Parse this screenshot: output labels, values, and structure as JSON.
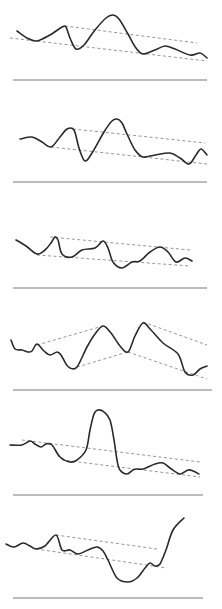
{
  "figure": {
    "colors": {
      "curve": "#2a2a2a",
      "trendline": "#8a8a8a",
      "baseline": "#7a7a7a",
      "background": "#ffffff"
    }
  },
  "chart_data": [
    {
      "type": "line",
      "title": "",
      "xlabel": "",
      "ylabel": "",
      "grid": false,
      "series": [
        {
          "name": "curve",
          "points": [
            [
              17,
              31
            ],
            [
              27,
              38
            ],
            [
              37,
              41
            ],
            [
              50,
              35
            ],
            [
              62,
              27
            ],
            [
              66,
              27
            ],
            [
              70,
              38
            ],
            [
              76,
              49
            ],
            [
              84,
              45
            ],
            [
              95,
              30
            ],
            [
              106,
              18
            ],
            [
              113,
              15
            ],
            [
              119,
              19
            ],
            [
              128,
              34
            ],
            [
              136,
              48
            ],
            [
              143,
              54
            ],
            [
              155,
              50
            ],
            [
              165,
              46
            ],
            [
              175,
              49
            ],
            [
              190,
              55
            ],
            [
              200,
              53
            ],
            [
              207,
              58
            ]
          ]
        }
      ],
      "trendlines": [
        [
          [
            65,
            26
          ],
          [
            197,
            43
          ]
        ],
        [
          [
            10,
            38
          ],
          [
            207,
            61
          ]
        ]
      ],
      "baseline": {
        "y": 80,
        "x1": 13,
        "x2": 207
      }
    },
    {
      "type": "line",
      "title": "",
      "xlabel": "",
      "ylabel": "",
      "grid": false,
      "series": [
        {
          "name": "curve",
          "points": [
            [
              20,
              139
            ],
            [
              32,
              137
            ],
            [
              42,
              142
            ],
            [
              51,
              147
            ],
            [
              60,
              137
            ],
            [
              67,
              129
            ],
            [
              74,
              130
            ],
            [
              79,
              148
            ],
            [
              85,
              161
            ],
            [
              92,
              153
            ],
            [
              104,
              132
            ],
            [
              112,
              121
            ],
            [
              117,
              119
            ],
            [
              122,
              123
            ],
            [
              127,
              134
            ],
            [
              135,
              150
            ],
            [
              143,
              157
            ],
            [
              155,
              155
            ],
            [
              170,
              153
            ],
            [
              180,
              158
            ],
            [
              189,
              164
            ],
            [
              196,
              155
            ],
            [
              201,
              149
            ],
            [
              207,
              155
            ]
          ]
        }
      ],
      "trendlines": [
        [
          [
            73,
            129
          ],
          [
            205,
            143
          ]
        ],
        [
          [
            51,
            147
          ],
          [
            207,
            164
          ]
        ]
      ],
      "baseline": {
        "y": 182,
        "x1": 13,
        "x2": 207
      }
    },
    {
      "type": "line",
      "title": "",
      "xlabel": "",
      "ylabel": "",
      "grid": false,
      "series": [
        {
          "name": "curve",
          "points": [
            [
              16,
              240
            ],
            [
              26,
              246
            ],
            [
              37,
              254
            ],
            [
              45,
              250
            ],
            [
              51,
              243
            ],
            [
              55,
              237
            ],
            [
              58,
              240
            ],
            [
              62,
              254
            ],
            [
              72,
              257
            ],
            [
              82,
              250
            ],
            [
              95,
              248
            ],
            [
              103,
              241
            ],
            [
              108,
              248
            ],
            [
              113,
              262
            ],
            [
              122,
              268
            ],
            [
              132,
              262
            ],
            [
              140,
              261
            ],
            [
              150,
              252
            ],
            [
              160,
              247
            ],
            [
              168,
              252
            ],
            [
              176,
              262
            ],
            [
              185,
              258
            ],
            [
              192,
              261
            ]
          ]
        }
      ],
      "trendlines": [
        [
          [
            50,
            237
          ],
          [
            190,
            250
          ]
        ],
        [
          [
            37,
            255
          ],
          [
            190,
            266
          ]
        ]
      ],
      "baseline": {
        "y": 288,
        "x1": 13,
        "x2": 207
      }
    },
    {
      "type": "line",
      "title": "",
      "xlabel": "",
      "ylabel": "",
      "grid": false,
      "series": [
        {
          "name": "curve",
          "points": [
            [
              11,
              340
            ],
            [
              15,
              349
            ],
            [
              22,
              350
            ],
            [
              28,
              352
            ],
            [
              32,
              351
            ],
            [
              37,
              344
            ],
            [
              44,
              351
            ],
            [
              50,
              355
            ],
            [
              57,
              352
            ],
            [
              61,
              355
            ],
            [
              66,
              364
            ],
            [
              70,
              368
            ],
            [
              77,
              367
            ],
            [
              87,
              347
            ],
            [
              95,
              334
            ],
            [
              103,
              326
            ],
            [
              111,
              333
            ],
            [
              120,
              346
            ],
            [
              128,
              352
            ],
            [
              135,
              336
            ],
            [
              143,
              323
            ],
            [
              151,
              330
            ],
            [
              163,
              343
            ],
            [
              178,
              354
            ],
            [
              185,
              372
            ],
            [
              193,
              375
            ],
            [
              200,
              369
            ],
            [
              207,
              366
            ]
          ]
        }
      ],
      "trendlines": [
        [
          [
            37,
            345
          ],
          [
            103,
            326
          ]
        ],
        [
          [
            143,
            322
          ],
          [
            207,
            345
          ]
        ],
        [
          [
            77,
            367
          ],
          [
            128,
            352
          ]
        ],
        [
          [
            128,
            352
          ],
          [
            207,
            379
          ]
        ]
      ],
      "baseline": {
        "y": 390,
        "x1": 13,
        "x2": 212
      }
    },
    {
      "type": "line",
      "title": "",
      "xlabel": "",
      "ylabel": "",
      "grid": false,
      "series": [
        {
          "name": "curve",
          "points": [
            [
              10,
              445
            ],
            [
              22,
              445
            ],
            [
              30,
              441
            ],
            [
              35,
              444
            ],
            [
              41,
              447
            ],
            [
              46,
              444
            ],
            [
              52,
              445
            ],
            [
              60,
              457
            ],
            [
              70,
              462
            ],
            [
              77,
              460
            ],
            [
              86,
              450
            ],
            [
              90,
              430
            ],
            [
              94,
              414
            ],
            [
              98,
              410
            ],
            [
              104,
              412
            ],
            [
              110,
              420
            ],
            [
              114,
              440
            ],
            [
              117,
              460
            ],
            [
              120,
              470
            ],
            [
              127,
              474
            ],
            [
              133,
              470
            ],
            [
              137,
              469
            ],
            [
              143,
              469
            ],
            [
              155,
              464
            ],
            [
              163,
              463
            ],
            [
              170,
              468
            ],
            [
              180,
              474
            ],
            [
              188,
              470
            ],
            [
              193,
              471
            ],
            [
              199,
              474
            ]
          ]
        }
      ],
      "trendlines": [
        [
          [
            22,
            440
          ],
          [
            200,
            462
          ]
        ],
        [
          [
            62,
            460
          ],
          [
            200,
            477
          ]
        ]
      ],
      "baseline": {
        "y": 495,
        "x1": 13,
        "x2": 203
      }
    },
    {
      "type": "line",
      "title": "",
      "xlabel": "",
      "ylabel": "",
      "grid": false,
      "series": [
        {
          "name": "curve",
          "points": [
            [
              6,
              544
            ],
            [
              14,
              547
            ],
            [
              23,
              543
            ],
            [
              30,
              546
            ],
            [
              36,
              549
            ],
            [
              45,
              546
            ],
            [
              56,
              535
            ],
            [
              62,
              550
            ],
            [
              70,
              550
            ],
            [
              78,
              554
            ],
            [
              88,
              550
            ],
            [
              97,
              547
            ],
            [
              103,
              551
            ],
            [
              108,
              560
            ],
            [
              117,
              578
            ],
            [
              128,
              582
            ],
            [
              137,
              578
            ],
            [
              145,
              568
            ],
            [
              150,
              563
            ],
            [
              155,
              566
            ],
            [
              160,
              564
            ],
            [
              166,
              550
            ],
            [
              173,
              530
            ],
            [
              184,
              518
            ]
          ]
        }
      ],
      "trendlines": [
        [
          [
            56,
            535
          ],
          [
            157,
            549
          ]
        ],
        [
          [
            36,
            549
          ],
          [
            167,
            568
          ]
        ]
      ],
      "baseline": {
        "y": 598,
        "x1": 13,
        "x2": 203
      }
    }
  ]
}
